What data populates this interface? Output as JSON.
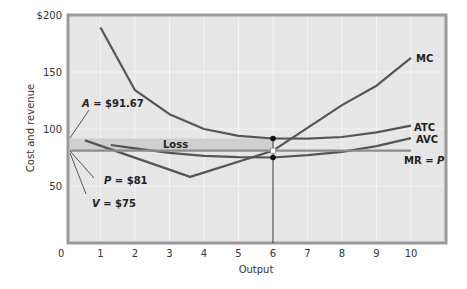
{
  "chart_data": {
    "type": "line",
    "title": "",
    "xlabel": "Output",
    "ylabel": "Cost and revenue",
    "xlim": [
      0,
      11
    ],
    "ylim": [
      0,
      200
    ],
    "xticks": [
      0,
      1,
      2,
      3,
      4,
      5,
      6,
      7,
      8,
      9,
      10
    ],
    "yticks": [
      {
        "value": 50,
        "label": "50"
      },
      {
        "value": 100,
        "label": "100"
      },
      {
        "value": 150,
        "label": "150"
      },
      {
        "value": 200,
        "label": "$200"
      }
    ],
    "grid": true,
    "series": [
      {
        "name": "MC",
        "label": "MC",
        "x": [
          0.55,
          3.6,
          6,
          7,
          8,
          9,
          10
        ],
        "y": [
          90,
          58,
          81,
          101,
          121,
          138,
          162.5
        ]
      },
      {
        "name": "ATC",
        "label": "ATC",
        "x": [
          1,
          2,
          3,
          4,
          5,
          6,
          7,
          8,
          9,
          10
        ],
        "y": [
          189,
          134,
          113,
          100,
          94,
          91.67,
          91.5,
          93,
          97,
          103
        ]
      },
      {
        "name": "AVC",
        "label": "AVC",
        "x": [
          1.3,
          2,
          3,
          4,
          5,
          6,
          7,
          8,
          9,
          10
        ],
        "y": [
          86,
          83,
          79,
          76.5,
          75.3,
          75,
          77,
          80,
          85,
          92
        ]
      },
      {
        "name": "MR = P",
        "label": "MR = P",
        "x": [
          0,
          10
        ],
        "y": [
          81,
          81
        ]
      }
    ],
    "annotations": [
      {
        "text": "A = $91.67",
        "value": 91.67,
        "label_x": 1.25,
        "label_y": 113
      },
      {
        "text": "P = $81",
        "value": 81,
        "label_x": 1.2,
        "label_y": 58
      },
      {
        "text": "V = $75",
        "value": 75,
        "label_x": 0.7,
        "label_y": 40
      },
      {
        "text": "Loss",
        "region": {
          "x0": 0,
          "x1": 6,
          "y0": 81,
          "y1": 91.67
        }
      }
    ],
    "markers": [
      {
        "x": 6,
        "y": 91.67,
        "style": "filled"
      },
      {
        "x": 6,
        "y": 81,
        "style": "hollow"
      },
      {
        "x": 6,
        "y": 75,
        "style": "filled"
      }
    ],
    "vline": {
      "x": 6,
      "from": 0,
      "to": 91.67
    },
    "legend_position": "inline-right"
  },
  "labels": {
    "a": "A = $91.67",
    "p": "P = $81",
    "v": "V = $75",
    "loss": "Loss",
    "mc": "MC",
    "atc": "ATC",
    "avc": "AVC",
    "mrp": "MR = P",
    "xlabel": "Output",
    "ylabel": "Cost and revenue",
    "origin": "0"
  },
  "colors": {
    "plot_bg": "#e6e6e6",
    "plot_border": "#9a9a9a",
    "grid": "#f4f4f4",
    "curve": "#555555",
    "mr_line": "#8c8c8c",
    "loss_band": "#cfcfcf",
    "marker": "#111111"
  }
}
